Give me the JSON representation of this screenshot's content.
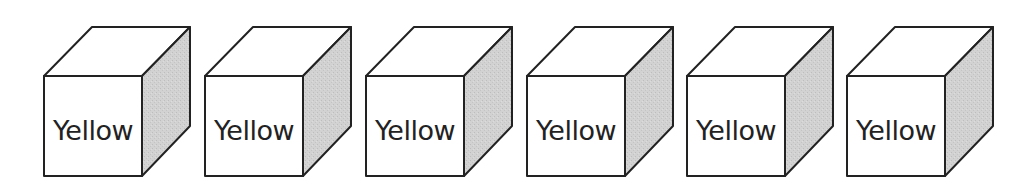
{
  "diagram": {
    "title": "",
    "colors": {
      "stroke": "#222222",
      "face": "#ffffff",
      "side_shade": "#cfcfcf",
      "text": "#222222"
    },
    "cubes": [
      {
        "label": "Yellow"
      },
      {
        "label": "Yellow"
      },
      {
        "label": "Yellow"
      },
      {
        "label": "Yellow"
      },
      {
        "label": "Yellow"
      },
      {
        "label": "Yellow"
      }
    ]
  }
}
